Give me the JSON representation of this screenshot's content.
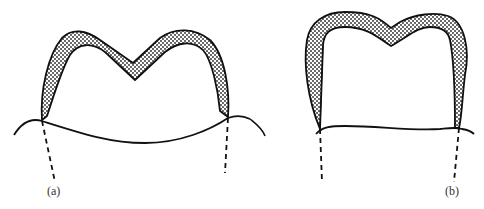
{
  "figure": {
    "panels": [
      {
        "id": "a",
        "label": "(a)",
        "description": "crown with deep central notch (M shape)"
      },
      {
        "id": "b",
        "label": "(b)",
        "description": "crown with shallow notch and square profile"
      }
    ],
    "colors": {
      "stroke": "#111111",
      "fill": "#ffffff",
      "stipple": "#222222"
    },
    "caption": ""
  }
}
